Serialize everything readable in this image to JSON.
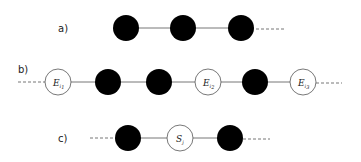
{
  "diagram": {
    "rows": [
      {
        "label": "a)",
        "nodes": [
          {
            "type": "filled",
            "text": ""
          },
          {
            "type": "filled",
            "text": ""
          },
          {
            "type": "filled",
            "text": ""
          }
        ],
        "left_dashed": false,
        "right_dashed": true
      },
      {
        "label": "b)",
        "nodes": [
          {
            "type": "open",
            "text": "E",
            "sub": "i",
            "subsub": "1"
          },
          {
            "type": "filled",
            "text": ""
          },
          {
            "type": "filled",
            "text": ""
          },
          {
            "type": "open",
            "text": "E",
            "sub": "i",
            "subsub": "2"
          },
          {
            "type": "filled",
            "text": ""
          },
          {
            "type": "open",
            "text": "E",
            "sub": "i",
            "subsub": "3"
          }
        ],
        "left_dashed": true,
        "right_dashed": true
      },
      {
        "label": "c)",
        "nodes": [
          {
            "type": "filled",
            "text": ""
          },
          {
            "type": "open",
            "text": "S",
            "sub": "j",
            "subsub": ""
          },
          {
            "type": "filled",
            "text": ""
          }
        ],
        "left_dashed": true,
        "right_dashed": true
      }
    ],
    "colors": {
      "filled": "#000000",
      "open_fill": "#ffffff",
      "stroke": "#555555",
      "line": "#777777"
    }
  }
}
